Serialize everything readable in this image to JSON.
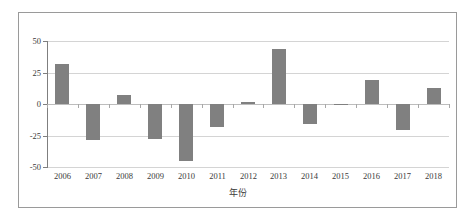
{
  "chart_data": {
    "type": "bar",
    "title": "",
    "subtitle": "",
    "xlabel": "年份",
    "ylabel": "",
    "categories": [
      "2006",
      "2007",
      "2008",
      "2009",
      "2010",
      "2011",
      "2012",
      "2013",
      "2014",
      "2015",
      "2016",
      "2017",
      "2018"
    ],
    "values": [
      32,
      -28.5,
      7,
      -27.5,
      -45,
      -18,
      1.5,
      43.5,
      -16,
      -1,
      19,
      -21,
      13
    ],
    "ylim": [
      -50,
      50
    ],
    "yticks": [
      50,
      25,
      0,
      -25,
      -50
    ],
    "ytick_labels": [
      "50",
      "25",
      "0",
      "-25",
      "-50"
    ],
    "grid": true,
    "grid_axis": "y",
    "legend": false,
    "legend_position": "none",
    "bar_color": "#808080",
    "gridline_color": "#d4d4d4",
    "axis_color": "#7f7f7f",
    "frame_color": "#9a9a9a",
    "background_color": "#ffffff",
    "annotations": []
  },
  "figure": {
    "frame_visible": true,
    "zero_line_label": "0"
  }
}
